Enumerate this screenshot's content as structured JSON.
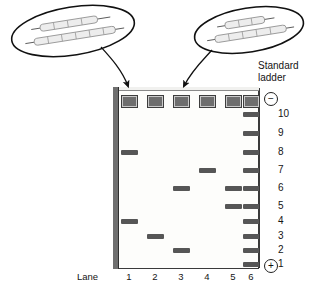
{
  "figure": {
    "type": "gel-electrophoresis-diagram",
    "title": "",
    "standard_ladder_caption_line1": "Standard",
    "standard_ladder_caption_line2": "ladder",
    "lane_word": "Lane",
    "lane_labels": [
      "1",
      "2",
      "3",
      "4",
      "5",
      "6"
    ],
    "polarity": {
      "top": "−",
      "bottom": "+"
    }
  },
  "callouts": [
    {
      "id": "callout-left",
      "label": "4, 8",
      "points_to_lane": "1",
      "fragments": [
        {
          "name": "short-fragment",
          "segments": 3
        },
        {
          "name": "long-fragment",
          "segments": 6
        }
      ]
    },
    {
      "id": "callout-right",
      "label": "2, 6",
      "points_to_lane": "3",
      "fragments": [
        {
          "name": "short-fragment",
          "segments": 2
        },
        {
          "name": "long-fragment",
          "segments": 5
        }
      ]
    }
  ],
  "chart_data": {
    "type": "table",
    "xlabel": "Lane",
    "ylabel": "Standard ladder position",
    "categories": [
      "1",
      "2",
      "3",
      "4",
      "5",
      "6"
    ],
    "ladder_rungs": [
      10,
      9,
      8,
      7,
      6,
      5,
      4,
      3,
      2,
      1
    ],
    "legend": [
      "Standard ladder"
    ],
    "series": [
      {
        "name": "Lane 1",
        "bands": [
          8,
          4
        ]
      },
      {
        "name": "Lane 2",
        "bands": [
          3
        ]
      },
      {
        "name": "Lane 3",
        "bands": [
          6,
          2
        ]
      },
      {
        "name": "Lane 4",
        "bands": [
          7
        ]
      },
      {
        "name": "Lane 5",
        "bands": [
          6,
          5
        ]
      },
      {
        "name": "Lane 6",
        "bands": [
          10,
          9,
          8,
          7,
          6,
          5,
          4,
          3,
          2,
          1
        ]
      }
    ],
    "wells_per_lane": 1,
    "grid": false,
    "legend_position": "top-right"
  },
  "geometry": {
    "lane_x": [
      121,
      147,
      173,
      199,
      225,
      243
    ],
    "well_y": 95,
    "rung_y": [
      112,
      131,
      150,
      168,
      186,
      204,
      219,
      234,
      248,
      262
    ],
    "ladder_label_x": 278
  }
}
